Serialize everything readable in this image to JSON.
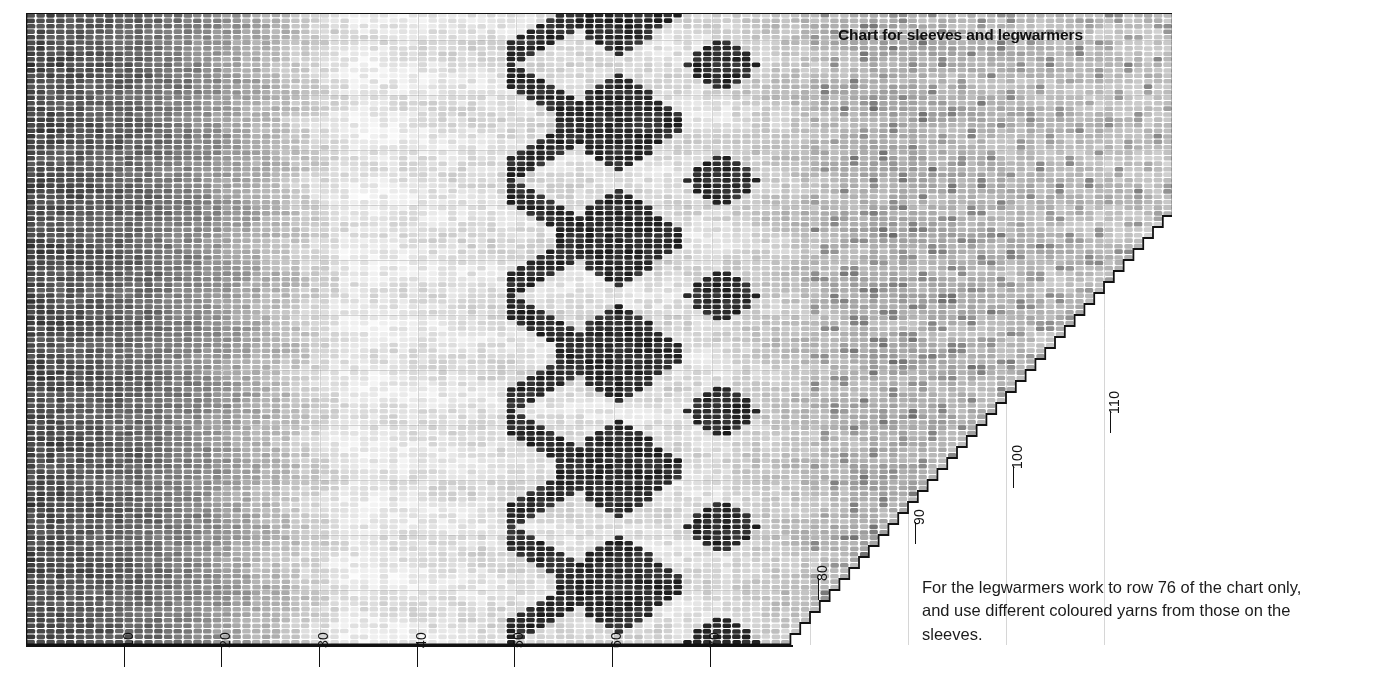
{
  "document": {
    "kind": "knitting-chart-page",
    "background_color": "#ffffff"
  },
  "chart_title": "Chart for sleeves and legwarmers",
  "caption": "For the legwarmers work to row 76 of the chart only, and use different coloured yarns from those on the sleeves.",
  "axes": {
    "bottom": {
      "orientation": "horizontal",
      "label_rotation_deg": -90,
      "ticks": [
        {
          "label": "10",
          "x": 124
        },
        {
          "label": "20",
          "x": 221
        },
        {
          "label": "30",
          "x": 319
        },
        {
          "label": "40",
          "x": 417
        },
        {
          "label": "50",
          "x": 514
        },
        {
          "label": "60",
          "x": 612
        },
        {
          "label": "70",
          "x": 710
        }
      ]
    },
    "stepped_right": {
      "orientation": "diagonal-stepped",
      "label_rotation_deg": -90,
      "ticks": [
        {
          "label": "80",
          "x": 818,
          "y": 578
        },
        {
          "label": "90",
          "x": 915,
          "y": 522
        },
        {
          "label": "100",
          "x": 1013,
          "y": 466
        },
        {
          "label": "110",
          "x": 1110,
          "y": 411
        }
      ]
    }
  },
  "chart_data": {
    "type": "heatmap",
    "title": "Chart for sleeves and legwarmers",
    "xlabel": "",
    "ylabel": "",
    "grid": {
      "columns": 117,
      "rows": 115,
      "cell_width_px": 9.8,
      "cell_height_px": 5.5,
      "origin_x_px": 26,
      "origin_y_px": 13
    },
    "xlim": [
      0,
      117
    ],
    "ylim": [
      0,
      115
    ],
    "grid_on": true,
    "legend_position": "none",
    "palette": {
      "darkest": "#2c2c2c",
      "dark": "#4a4a4a",
      "mid_dark": "#6e6e6e",
      "mid": "#8f8f8f",
      "mid_light": "#b3b3b3",
      "light": "#d6d6d6",
      "lightest": "#f1f1f1",
      "paper": "#ffffff",
      "grid_line": "#ffffff",
      "outline": "#111111"
    },
    "bands": [
      {
        "name": "left-dark-band",
        "x_start": 0,
        "x_end": 12,
        "tone": "darkest"
      },
      {
        "name": "left-gradient",
        "x_start": 12,
        "x_end": 32,
        "tone": "dark-to-mid"
      },
      {
        "name": "pale-centre",
        "x_start": 32,
        "x_end": 50,
        "tone": "lightest"
      },
      {
        "name": "diamond-motif-band",
        "x_start": 50,
        "x_end": 72,
        "tone": "darkest-on-light"
      },
      {
        "name": "right-midgrey-field",
        "x_start": 72,
        "x_end": 117,
        "tone": "mid_light"
      }
    ],
    "stepped_edge": {
      "note": "Right edge rises one column every 2 rows from the bottom-right corner of the rectangular block up to the top-right corner.",
      "start": {
        "column": 78,
        "row": 0
      },
      "end": {
        "column": 117,
        "row": 115
      },
      "rows_per_step": 2
    }
  }
}
